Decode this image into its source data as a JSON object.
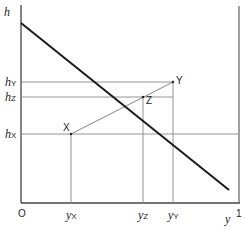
{
  "diagram": {
    "axis_labels": {
      "vertical": "h",
      "horizontal": "y",
      "origin": "O",
      "x_max": "1"
    },
    "h_ticks": [
      {
        "base": "h",
        "sub": "Y",
        "y": 82
      },
      {
        "base": "h",
        "sub": "Z",
        "y": 97
      },
      {
        "base": "h",
        "sub": "X",
        "y": 134
      }
    ],
    "y_ticks": [
      {
        "base": "y",
        "sub": "X",
        "x": 71
      },
      {
        "base": "y",
        "sub": "Z",
        "x": 143
      },
      {
        "base": "y",
        "sub": "Y",
        "x": 173
      }
    ],
    "points": [
      {
        "label": "X",
        "x": 71,
        "y": 134
      },
      {
        "label": "Z",
        "x": 143,
        "y": 97
      },
      {
        "label": "Y",
        "x": 173,
        "y": 82
      }
    ],
    "main_line": {
      "x1": 21,
      "y1": 23,
      "x2": 229,
      "y2": 190
    },
    "colors": {
      "axis": "#444444",
      "thin": "#888888",
      "main": "#1a1a1a"
    }
  }
}
